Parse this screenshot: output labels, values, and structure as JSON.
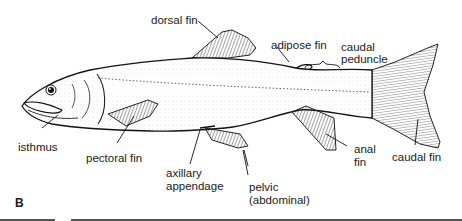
{
  "figure": {
    "panel_letter": "B",
    "labels": {
      "dorsal_fin": "dorsal fin",
      "adipose_fin": "adipose fin",
      "caudal_peduncle_1": "caudal",
      "caudal_peduncle_2": "peduncle",
      "isthmus": "isthmus",
      "pectoral_fin": "pectoral fin",
      "axillary_1": "axillary",
      "axillary_2": "appendage",
      "pelvic_1": "pelvic",
      "pelvic_2": "(abdominal)",
      "anal_1": "anal",
      "anal_2": "fin",
      "caudal_fin": "caudal fin"
    }
  }
}
